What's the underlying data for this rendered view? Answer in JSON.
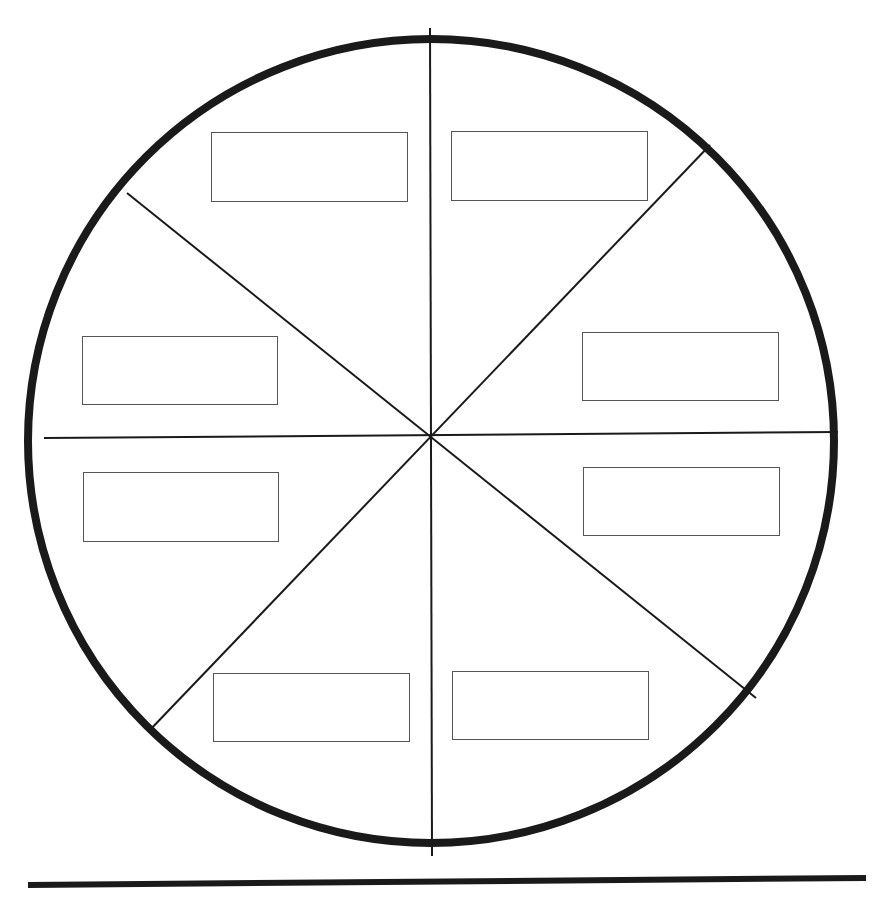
{
  "diagram": {
    "type": "sector-wheel",
    "colors": {
      "stroke": "#1a1a1a",
      "box_border": "#555555",
      "background": "#ffffff"
    },
    "circle": {
      "cx": 431,
      "cy": 441,
      "rx": 403,
      "ry": 402,
      "stroke_width": 8
    },
    "center": {
      "x": 431,
      "y": 437
    },
    "spokes": [
      {
        "id": "vertical",
        "x1": 430,
        "y1": 28,
        "x2": 432,
        "y2": 856
      },
      {
        "id": "horizontal",
        "x1": 44,
        "y1": 438,
        "x2": 838,
        "y2": 432
      },
      {
        "id": "diag-ul-lr",
        "x1": 127,
        "y1": 193,
        "x2": 756,
        "y2": 698
      },
      {
        "id": "diag-ur-ll",
        "x1": 710,
        "y1": 145,
        "x2": 148,
        "y2": 732
      }
    ],
    "ground_line": {
      "x1": 28,
      "y1": 885,
      "x2": 866,
      "y2": 878,
      "stroke_width": 6
    },
    "label_boxes": [
      {
        "id": "sector-top-left",
        "x": 211,
        "y": 132,
        "w": 197,
        "h": 70,
        "text": ""
      },
      {
        "id": "sector-top-right",
        "x": 451,
        "y": 131,
        "w": 197,
        "h": 70,
        "text": ""
      },
      {
        "id": "sector-upper-left",
        "x": 82,
        "y": 336,
        "w": 196,
        "h": 69,
        "text": ""
      },
      {
        "id": "sector-upper-right",
        "x": 582,
        "y": 332,
        "w": 197,
        "h": 69,
        "text": ""
      },
      {
        "id": "sector-lower-left",
        "x": 83,
        "y": 472,
        "w": 196,
        "h": 70,
        "text": ""
      },
      {
        "id": "sector-lower-right",
        "x": 583,
        "y": 467,
        "w": 197,
        "h": 69,
        "text": ""
      },
      {
        "id": "sector-bottom-left",
        "x": 213,
        "y": 673,
        "w": 197,
        "h": 69,
        "text": ""
      },
      {
        "id": "sector-bottom-right",
        "x": 452,
        "y": 671,
        "w": 197,
        "h": 69,
        "text": ""
      }
    ]
  }
}
